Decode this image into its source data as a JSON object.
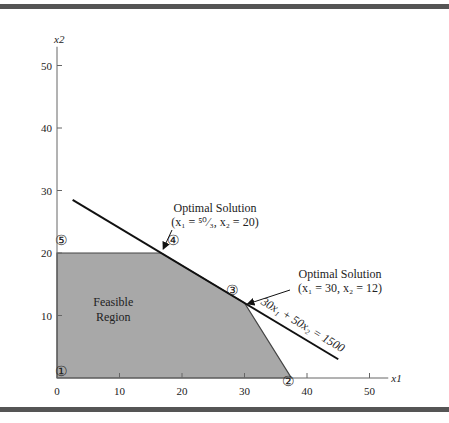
{
  "chart_data": {
    "type": "area",
    "title": "",
    "xlabel": "x1",
    "ylabel": "x2",
    "xlim": [
      0,
      53
    ],
    "ylim": [
      0,
      53
    ],
    "x_ticks": [
      0,
      10,
      20,
      30,
      40,
      50
    ],
    "y_ticks": [
      10,
      20,
      30,
      40,
      50
    ],
    "x_tick_labels": [
      "0",
      "10",
      "20",
      "30",
      "40",
      "50"
    ],
    "y_tick_labels": [
      "10",
      "20",
      "30",
      "40",
      "50"
    ],
    "feasible_region": {
      "label_lines": [
        "Feasible",
        "Region"
      ],
      "vertices": [
        [
          0,
          0
        ],
        [
          0,
          20
        ],
        [
          16.67,
          20
        ],
        [
          30,
          12
        ],
        [
          37.5,
          0
        ]
      ],
      "color": "#a8a8a8"
    },
    "objective_line": {
      "label": "30x₁ + 50x₂ = 1500",
      "from": [
        2.5,
        28.5
      ],
      "to": [
        45,
        3
      ]
    },
    "corner_points": [
      {
        "label": "①",
        "x": 0,
        "y": 0
      },
      {
        "label": "②",
        "x": 37.5,
        "y": 0
      },
      {
        "label": "③",
        "x": 30,
        "y": 12
      },
      {
        "label": "④",
        "x": 16.67,
        "y": 20
      },
      {
        "label": "⑤",
        "x": 0,
        "y": 20
      }
    ],
    "annotations": [
      {
        "title": "Optimal Solution",
        "text": "(x₁ = ⁵⁰⁄₃, x₂ = 20)",
        "points_to": [
          16.67,
          20
        ]
      },
      {
        "title": "Optimal Solution",
        "text": "(x₁ = 30, x₂ = 12)",
        "points_to": [
          30,
          12
        ]
      }
    ]
  }
}
